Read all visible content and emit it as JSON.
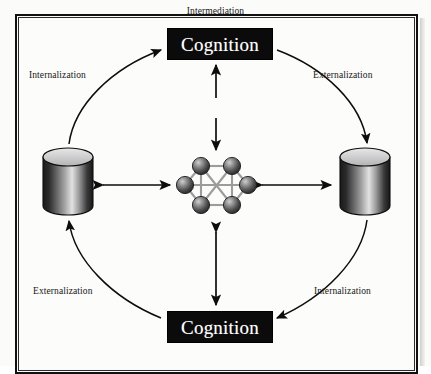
{
  "figure": {
    "type": "cycle-diagram",
    "background_color": "#fbfbf9",
    "frame_color": "#111111"
  },
  "nodes": {
    "cognition_top": {
      "label": "Cognition",
      "shape": "filled-rectangle",
      "fill_color": "#0b0b0b",
      "text_color": "#ffffff"
    },
    "cognition_bottom": {
      "label": "Cognition",
      "shape": "filled-rectangle",
      "fill_color": "#0b0b0b",
      "text_color": "#ffffff"
    },
    "database_left": {
      "label": "",
      "shape": "cylinder",
      "top_fill": "#c9c9c9",
      "body_dark": "#1c1c1c",
      "body_light": "#d8d8d8"
    },
    "database_right": {
      "label": "",
      "shape": "cylinder",
      "top_fill": "#c9c9c9",
      "body_dark": "#1c1c1c",
      "body_light": "#d8d8d8"
    },
    "network": {
      "label": "",
      "shape": "hexagonal-node-graph",
      "node_count": 6,
      "node_fill": "#6e6e6e",
      "edge_color": "#9a9a9a"
    }
  },
  "labels": {
    "top_left": "Internalization",
    "top_right": "Externalization",
    "bottom_left": "Externalization",
    "bottom_right": "Internalization",
    "center": "Intermediation"
  },
  "arrows": {
    "curve_top_left": {
      "from": "database_left",
      "to": "cognition_top",
      "style": "curved-single-head",
      "label": "Internalization"
    },
    "curve_top_right": {
      "from": "cognition_top",
      "to": "database_right",
      "style": "curved-single-head",
      "label": "Externalization"
    },
    "curve_bottom_right": {
      "from": "database_right",
      "to": "cognition_bottom",
      "style": "curved-single-head",
      "label": "Internalization"
    },
    "curve_bottom_left": {
      "from": "cognition_bottom",
      "to": "database_left",
      "style": "curved-single-head",
      "label": "Externalization"
    },
    "straight_left": {
      "from": "database_left",
      "to": "network",
      "style": "double-head-horizontal"
    },
    "straight_right": {
      "from": "network",
      "to": "database_right",
      "style": "double-head-horizontal"
    },
    "straight_top": {
      "from": "network",
      "to": "cognition_top",
      "style": "double-head-vertical",
      "label": "Intermediation"
    },
    "straight_bottom": {
      "from": "network",
      "to": "cognition_bottom",
      "style": "double-head-vertical"
    }
  }
}
